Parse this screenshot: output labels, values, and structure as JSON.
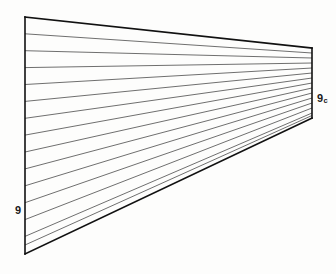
{
  "figure": {
    "kind": "ruled-surface-line-diagram",
    "background_color": "#fdfdfc",
    "canvas": {
      "width": 336,
      "height": 274
    },
    "outline": {
      "stroke_color": "#111111",
      "stroke_width": 1.6,
      "left_edge": {
        "x": 25,
        "y_top": 17,
        "y_bottom": 254
      },
      "right_edge": {
        "x": 312,
        "y_top": 48,
        "y_bottom": 118
      },
      "top_edge": {
        "x1": 25,
        "y1": 17,
        "x2": 312,
        "y2": 48
      },
      "bottom_edge": {
        "x1": 25,
        "y1": 254,
        "x2": 312,
        "y2": 118
      }
    },
    "rulings": {
      "stroke_color": "#4a4a4a",
      "stroke_width": 0.8,
      "count": 14,
      "description": "evenly spaced generator lines from left edge to right edge",
      "lines": [
        {
          "x1": 25,
          "y1": 33.8,
          "x2": 312,
          "y2": 53.0
        },
        {
          "x1": 25,
          "y1": 50.7,
          "x2": 312,
          "y2": 58.0
        },
        {
          "x1": 25,
          "y1": 67.6,
          "x2": 312,
          "y2": 63.0
        },
        {
          "x1": 25,
          "y1": 84.5,
          "x2": 312,
          "y2": 68.0
        },
        {
          "x1": 25,
          "y1": 101.4,
          "x2": 312,
          "y2": 73.0
        },
        {
          "x1": 25,
          "y1": 118.3,
          "x2": 312,
          "y2": 78.0
        },
        {
          "x1": 25,
          "y1": 135.1,
          "x2": 312,
          "y2": 83.0
        },
        {
          "x1": 25,
          "y1": 152.0,
          "x2": 312,
          "y2": 88.0
        },
        {
          "x1": 25,
          "y1": 168.9,
          "x2": 312,
          "y2": 93.0
        },
        {
          "x1": 25,
          "y1": 185.8,
          "x2": 312,
          "y2": 98.0
        },
        {
          "x1": 25,
          "y1": 202.7,
          "x2": 312,
          "y2": 103.0
        },
        {
          "x1": 25,
          "y1": 219.6,
          "x2": 312,
          "y2": 108.0
        },
        {
          "x1": 25,
          "y1": 236.4,
          "x2": 312,
          "y2": 113.0
        },
        {
          "x1": 25,
          "y1": 245.0,
          "x2": 312,
          "y2": 115.5
        }
      ]
    },
    "labels": {
      "left": {
        "text": "9",
        "subscript": "",
        "x": 15,
        "y": 211
      },
      "right": {
        "text": "9",
        "subscript": "c",
        "x": 317,
        "y": 99
      }
    }
  }
}
